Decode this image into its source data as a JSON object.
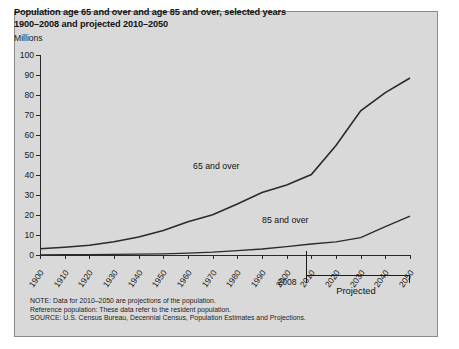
{
  "title": {
    "line1": "Population age 65 and over and age 85 and over, selected years",
    "line2": "1900–2008 and projected 2010–2050"
  },
  "axis_unit_label": "Millions",
  "marker_2008": "2008",
  "projected_label": "Projected",
  "notes": [
    "NOTE: Data for 2010–2050 are projections of the population.",
    "Reference population: These data refer to the resident population.",
    "SOURCE: U.S. Census Bureau, Decennial Census, Population Estimates and Projections."
  ],
  "watermark": "",
  "colors": {
    "panel_background": "#d9d9d9",
    "line": "#2a2a2a",
    "axis": "#2a2a2a",
    "text": "#121212"
  },
  "chart_data": {
    "type": "line",
    "title": "Population age 65 and over and age 85 and over, selected years 1900–2008 and projected 2010–2050",
    "xlabel": "",
    "ylabel": "Millions",
    "xlim": [
      1900,
      2050
    ],
    "ylim": [
      0,
      100
    ],
    "yticks": [
      0,
      10,
      20,
      30,
      40,
      50,
      60,
      70,
      80,
      90,
      100
    ],
    "xticks": [
      1900,
      1910,
      1920,
      1930,
      1940,
      1950,
      1960,
      1970,
      1980,
      1990,
      2000,
      2010,
      2020,
      2030,
      2040,
      2050
    ],
    "grid": false,
    "legend_position": "inline-labels",
    "annotations": [
      {
        "text": "65 and over",
        "x": 1975,
        "y": 44
      },
      {
        "text": "85 and over",
        "x": 2003,
        "y": 17
      },
      {
        "text": "2008",
        "x": 2008,
        "y": -8
      },
      {
        "text": "Projected",
        "x": 2030,
        "y": -12
      }
    ],
    "x": [
      1900,
      1910,
      1920,
      1930,
      1940,
      1950,
      1960,
      1970,
      1980,
      1990,
      2000,
      2010,
      2020,
      2030,
      2040,
      2050
    ],
    "series": [
      {
        "name": "65 and over",
        "values": [
          3.1,
          3.9,
          4.9,
          6.6,
          9.0,
          12.3,
          16.6,
          20.1,
          25.5,
          31.2,
          35.0,
          40.2,
          54.8,
          72.1,
          81.2,
          88.5
        ]
      },
      {
        "name": "85 and over",
        "values": [
          0.1,
          0.2,
          0.2,
          0.3,
          0.4,
          0.6,
          0.9,
          1.4,
          2.2,
          3.0,
          4.2,
          5.5,
          6.6,
          8.7,
          14.2,
          19.4
        ]
      }
    ]
  }
}
